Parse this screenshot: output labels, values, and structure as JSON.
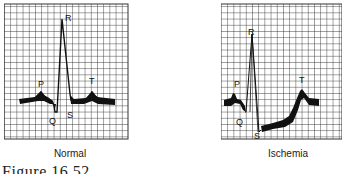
{
  "figure": {
    "caption": "Figure 16.52"
  },
  "panels": [
    {
      "id": "normal",
      "title": "Normal",
      "wave_labels": {
        "P": "P",
        "Q": "Q",
        "R": "R",
        "S": "S",
        "T": "T"
      },
      "description": "Normal ECG complex with isoelectric ST segment"
    },
    {
      "id": "ischemia",
      "title": "Ischemia",
      "wave_labels": {
        "P": "P",
        "Q": "Q",
        "R": "R",
        "S": "S",
        "T": "T"
      },
      "description": "ECG complex showing ST-segment depression indicative of ischemia"
    }
  ],
  "colors": {
    "grid": "#333333",
    "trace": "#111111",
    "background": "#ffffff"
  }
}
